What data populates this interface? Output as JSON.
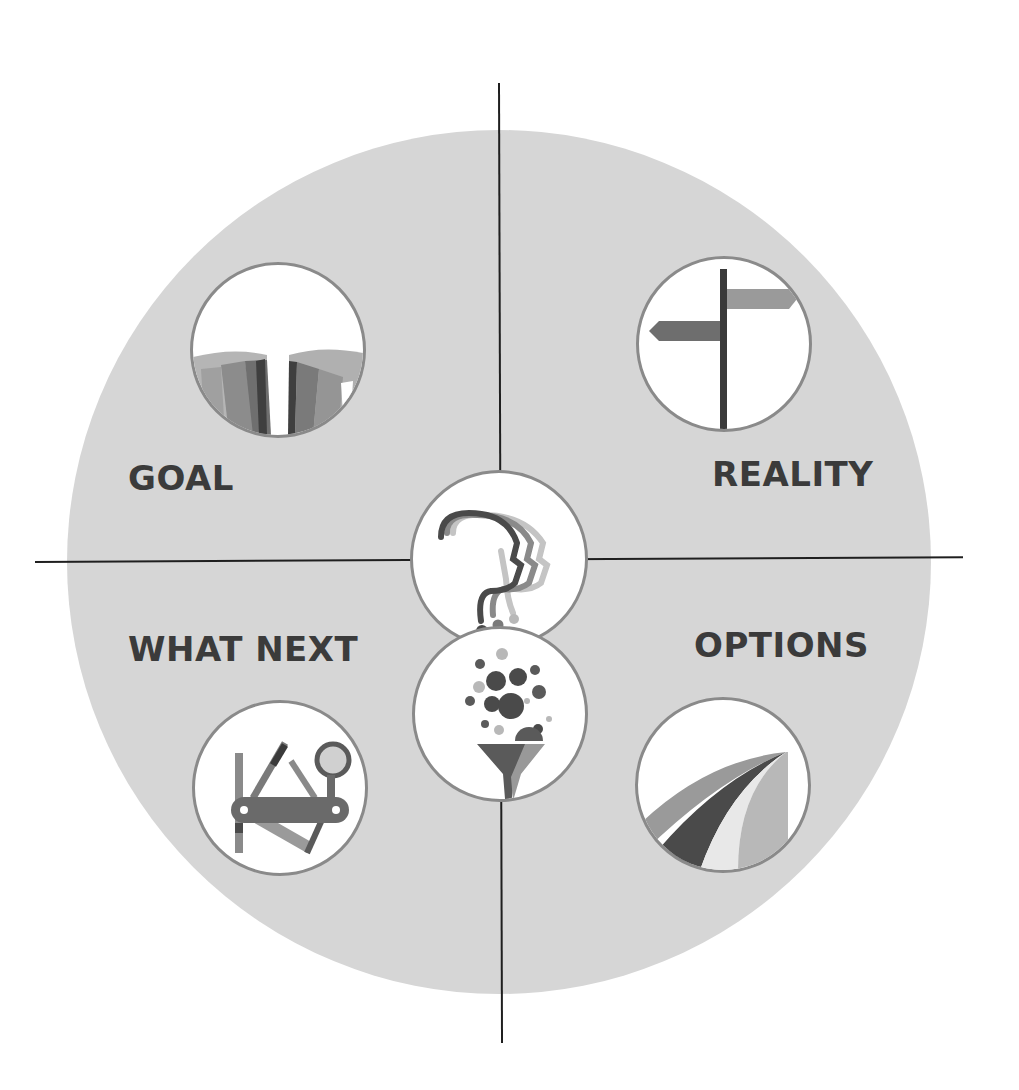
{
  "diagram": {
    "quadrants": [
      {
        "id": "goal",
        "label": "GOAL",
        "icon": "canyon-gap-icon"
      },
      {
        "id": "reality",
        "label": "REALITY",
        "icon": "signpost-icon"
      },
      {
        "id": "what_next",
        "label": "WHAT NEXT",
        "icon": "multitool-icon"
      },
      {
        "id": "options",
        "label": "OPTIONS",
        "icon": "diverging-paths-icon"
      }
    ],
    "center": {
      "top_icon": "thinking-heads-question-icon",
      "bottom_icon": "funnel-ideas-icon"
    }
  },
  "colors": {
    "background": "#ffffff",
    "big_circle": "#d6d6d6",
    "axis": "#1f1f1f",
    "label_text": "#3b3b3b",
    "icon_border": "#8a8a8a",
    "dark_gray": "#4a4a4a",
    "mid_gray": "#7a7a7a",
    "light_gray": "#a8a8a8"
  }
}
